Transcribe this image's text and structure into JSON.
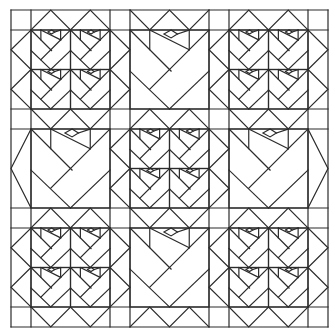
{
  "figure": {
    "colors": {
      "line": "#2b2b2b",
      "background": "#ffffff"
    },
    "grid": {
      "x": [
        11,
        31,
        110,
        130,
        209,
        229,
        308,
        328
      ],
      "y": [
        10,
        30,
        109,
        129,
        208,
        228,
        307,
        327
      ],
      "block_size": 79,
      "sashing_width": 20
    },
    "blocks": [
      [
        "four-rose",
        "big-rose",
        "four-rose"
      ],
      [
        "big-rose",
        "four-rose",
        "big-rose"
      ],
      [
        "four-rose",
        "big-rose",
        "four-rose"
      ]
    ]
  }
}
